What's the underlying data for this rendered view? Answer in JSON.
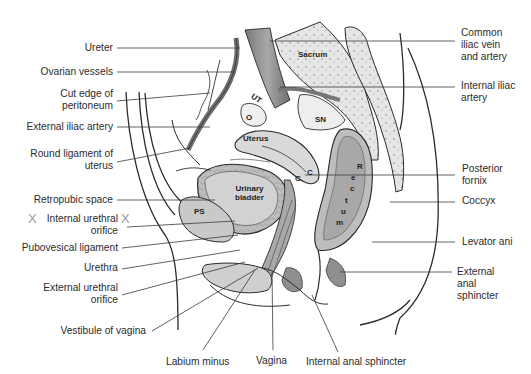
{
  "figure": {
    "colors": {
      "background": "#ffffff",
      "outline": "#2a2a2a",
      "organ_fill": "#d6d6d6",
      "organ_dark": "#9c9c9c",
      "bone_fill": "#e8e8e8",
      "leader_line": "#3a3a3a",
      "x_mark": "#9a9a9a"
    }
  },
  "labels_left": [
    {
      "id": "ureter",
      "lines": [
        "Ureter"
      ]
    },
    {
      "id": "ovarian-vessels",
      "lines": [
        "Ovarian vessels"
      ]
    },
    {
      "id": "cut-edge-of-peritoneum",
      "lines": [
        "Cut edge of",
        "peritoneum"
      ]
    },
    {
      "id": "external-iliac-artery",
      "lines": [
        "External iliac artery"
      ]
    },
    {
      "id": "round-ligament-of-uterus",
      "lines": [
        "Round ligament of",
        "uterus"
      ]
    },
    {
      "id": "retropubic-space",
      "lines": [
        "Retropubic space"
      ]
    },
    {
      "id": "internal-urethral-orifice",
      "lines": [
        "Internal urethral",
        "orifice"
      ]
    },
    {
      "id": "pubovesical-ligament",
      "lines": [
        "Pubovesical ligament"
      ]
    },
    {
      "id": "urethra",
      "lines": [
        "Urethra"
      ]
    },
    {
      "id": "external-urethral-orifice",
      "lines": [
        "External urethral",
        "orifice"
      ]
    },
    {
      "id": "vestibule-of-vagina",
      "lines": [
        "Vestibule of vagina"
      ]
    }
  ],
  "labels_right": [
    {
      "id": "common-iliac-vein-and-artery",
      "lines": [
        "Common",
        "iliac vein",
        "and artery"
      ]
    },
    {
      "id": "internal-iliac-artery",
      "lines": [
        "Internal iliac",
        "artery"
      ]
    },
    {
      "id": "posterior-fornix",
      "lines": [
        "Posterior",
        "fornix"
      ]
    },
    {
      "id": "coccyx",
      "lines": [
        "Coccyx"
      ]
    },
    {
      "id": "levator-ani",
      "lines": [
        "Levator ani"
      ]
    },
    {
      "id": "external-anal-sphincter",
      "lines": [
        "External",
        "anal",
        "sphincter"
      ]
    }
  ],
  "labels_bottom": [
    {
      "id": "labium-minus",
      "lines": [
        "Labium minus"
      ]
    },
    {
      "id": "vagina",
      "lines": [
        "Vagina"
      ]
    },
    {
      "id": "internal-anal-sphincter",
      "lines": [
        "Internal anal sphincter"
      ]
    }
  ],
  "inline_labels": {
    "sacrum": "Sacrum",
    "sn": "SN",
    "ut": "UT",
    "o": "O",
    "uterus": "Uterus",
    "urinary_bladder": [
      "Urinary",
      "bladder"
    ],
    "ps": "PS",
    "c1": "C",
    "c2": "C",
    "rectum_letters": [
      "R",
      "e",
      "c",
      "t",
      "u",
      "m"
    ]
  },
  "x_marks": [
    "X",
    "X"
  ]
}
